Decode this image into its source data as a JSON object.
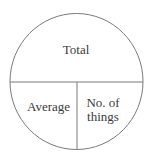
{
  "diagram": {
    "type": "formula-circle",
    "sections": {
      "top": {
        "label": "Total"
      },
      "bottom_left": {
        "label": "Average"
      },
      "bottom_right": {
        "label_line1": "No. of",
        "label_line2": "things"
      }
    },
    "colors": {
      "stroke": "#7a7a7a",
      "text": "#3a3a3a",
      "background": "#ffffff"
    }
  }
}
